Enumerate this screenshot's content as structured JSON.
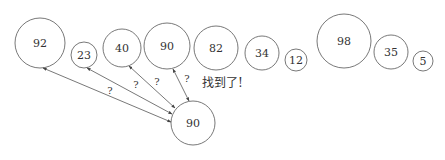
{
  "diagram": {
    "colors": {
      "stroke": "#555555",
      "text": "#333333",
      "background": "#ffffff"
    },
    "array": [
      {
        "value": "92",
        "cx": 40,
        "cy": 43,
        "r": 25
      },
      {
        "value": "23",
        "cx": 84,
        "cy": 55,
        "r": 13
      },
      {
        "value": "40",
        "cx": 122,
        "cy": 48,
        "r": 19
      },
      {
        "value": "90",
        "cx": 167,
        "cy": 46,
        "r": 23
      },
      {
        "value": "82",
        "cx": 216,
        "cy": 48,
        "r": 22
      },
      {
        "value": "34",
        "cx": 262,
        "cy": 53,
        "r": 17
      },
      {
        "value": "12",
        "cx": 296,
        "cy": 60,
        "r": 11
      },
      {
        "value": "98",
        "cx": 344,
        "cy": 41,
        "r": 27
      },
      {
        "value": "35",
        "cx": 391,
        "cy": 52,
        "r": 17
      },
      {
        "value": "5",
        "cx": 423,
        "cy": 61,
        "r": 10
      }
    ],
    "target": {
      "value": "90",
      "cx": 193,
      "cy": 123,
      "r": 22
    },
    "comparisons": [
      {
        "label": "?",
        "x1": 43,
        "y1": 68,
        "x2": 171,
        "y2": 122,
        "lx": 110,
        "ly": 94
      },
      {
        "label": "?",
        "x1": 87,
        "y1": 68,
        "x2": 172,
        "y2": 114,
        "lx": 136,
        "ly": 88
      },
      {
        "label": "?",
        "x1": 129,
        "y1": 66,
        "x2": 175,
        "y2": 108,
        "lx": 157,
        "ly": 85
      },
      {
        "label": "?",
        "x1": 173,
        "y1": 69,
        "x2": 189,
        "y2": 101,
        "lx": 187,
        "ly": 82
      }
    ],
    "found_label": "找到了!"
  }
}
